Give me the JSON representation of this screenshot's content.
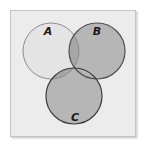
{
  "diagram": {
    "type": "venn",
    "background": "#ececec",
    "frame_border": "#c4c4c4",
    "sets": [
      {
        "id": "A",
        "label": "A",
        "cx": 51,
        "cy": 51,
        "r": 28,
        "fill": "#e6e6e6",
        "stroke": "#8a8a8a",
        "shaded": false
      },
      {
        "id": "B",
        "label": "B",
        "cx": 97,
        "cy": 51,
        "r": 28,
        "fill": "#b4b4b4",
        "stroke": "#4a4a4a",
        "shaded": true
      },
      {
        "id": "C",
        "label": "C",
        "cx": 74,
        "cy": 96,
        "r": 28,
        "fill": "#b4b4b4",
        "stroke": "#3a3a3a",
        "shaded": true
      }
    ],
    "labels": {
      "a": "A",
      "b": "B",
      "c": "C"
    },
    "shaded_region_description": "B ∪ C shaded; A unshaded except overlaps with B and C"
  }
}
